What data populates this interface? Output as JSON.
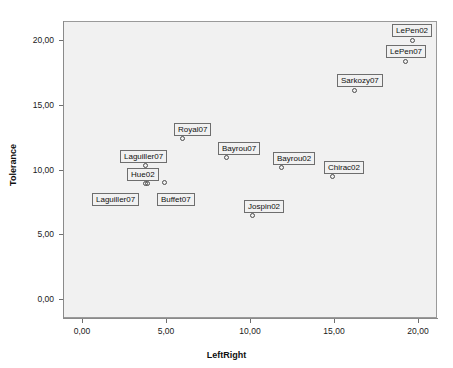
{
  "chart_data": {
    "type": "scatter",
    "title": "",
    "xlabel": "LeftRight",
    "ylabel": "Tolerance",
    "xlim": [
      -1.1,
      21.1
    ],
    "ylim": [
      -1.5,
      21.5
    ],
    "xticks": [
      "0,00",
      "5,00",
      "10,00",
      "15,00",
      "20,00"
    ],
    "xtick_values": [
      0,
      5,
      10,
      15,
      20
    ],
    "yticks": [
      "0,00",
      "5,00",
      "10,00",
      "15,00",
      "20,00"
    ],
    "ytick_values": [
      0,
      5,
      10,
      15,
      20
    ],
    "grid": false,
    "legend": "none",
    "point_label_field": "label",
    "points": [
      {
        "label": "LePen02",
        "x": 19.2,
        "y": 19.9,
        "px": 412,
        "py": 40,
        "lx": 392,
        "ly": 24
      },
      {
        "label": "LePen07",
        "x": 18.9,
        "y": 18.3,
        "px": 405,
        "py": 61,
        "lx": 386,
        "ly": 45
      },
      {
        "label": "Sarkozy07",
        "x": 16.2,
        "y": 16.0,
        "px": 354,
        "py": 90,
        "lx": 337,
        "ly": 74
      },
      {
        "label": "Royal07",
        "x": 6.0,
        "y": 12.1,
        "px": 182,
        "py": 138,
        "lx": 174,
        "ly": 123
      },
      {
        "label": "Bayrou07",
        "x": 8.6,
        "y": 10.6,
        "px": 226,
        "py": 157,
        "lx": 218,
        "ly": 142
      },
      {
        "label": "Bayrou02",
        "x": 11.8,
        "y": 9.8,
        "px": 281,
        "py": 167,
        "lx": 273,
        "ly": 152
      },
      {
        "label": "Chirac02",
        "x": 14.8,
        "y": 9.1,
        "px": 332,
        "py": 176,
        "lx": 324,
        "ly": 161
      },
      {
        "label": "Laguiller07",
        "x": 3.8,
        "y": 10.0,
        "px": 145,
        "py": 165,
        "lx": 120,
        "ly": 150
      },
      {
        "label": "Hue02",
        "x": 3.8,
        "y": 8.6,
        "px": 145,
        "py": 183,
        "lx": 127,
        "ly": 168
      },
      {
        "label": "Laguiller07",
        "x": 3.9,
        "y": 8.6,
        "px": 147,
        "py": 183,
        "lx": 92,
        "ly": 193
      },
      {
        "label": "Buffet07",
        "x": 4.9,
        "y": 8.7,
        "px": 164,
        "py": 182,
        "lx": 157,
        "ly": 193
      },
      {
        "label": "Jospin02",
        "x": 10.1,
        "y": 6.0,
        "px": 252,
        "py": 215,
        "lx": 244,
        "ly": 200
      }
    ]
  }
}
